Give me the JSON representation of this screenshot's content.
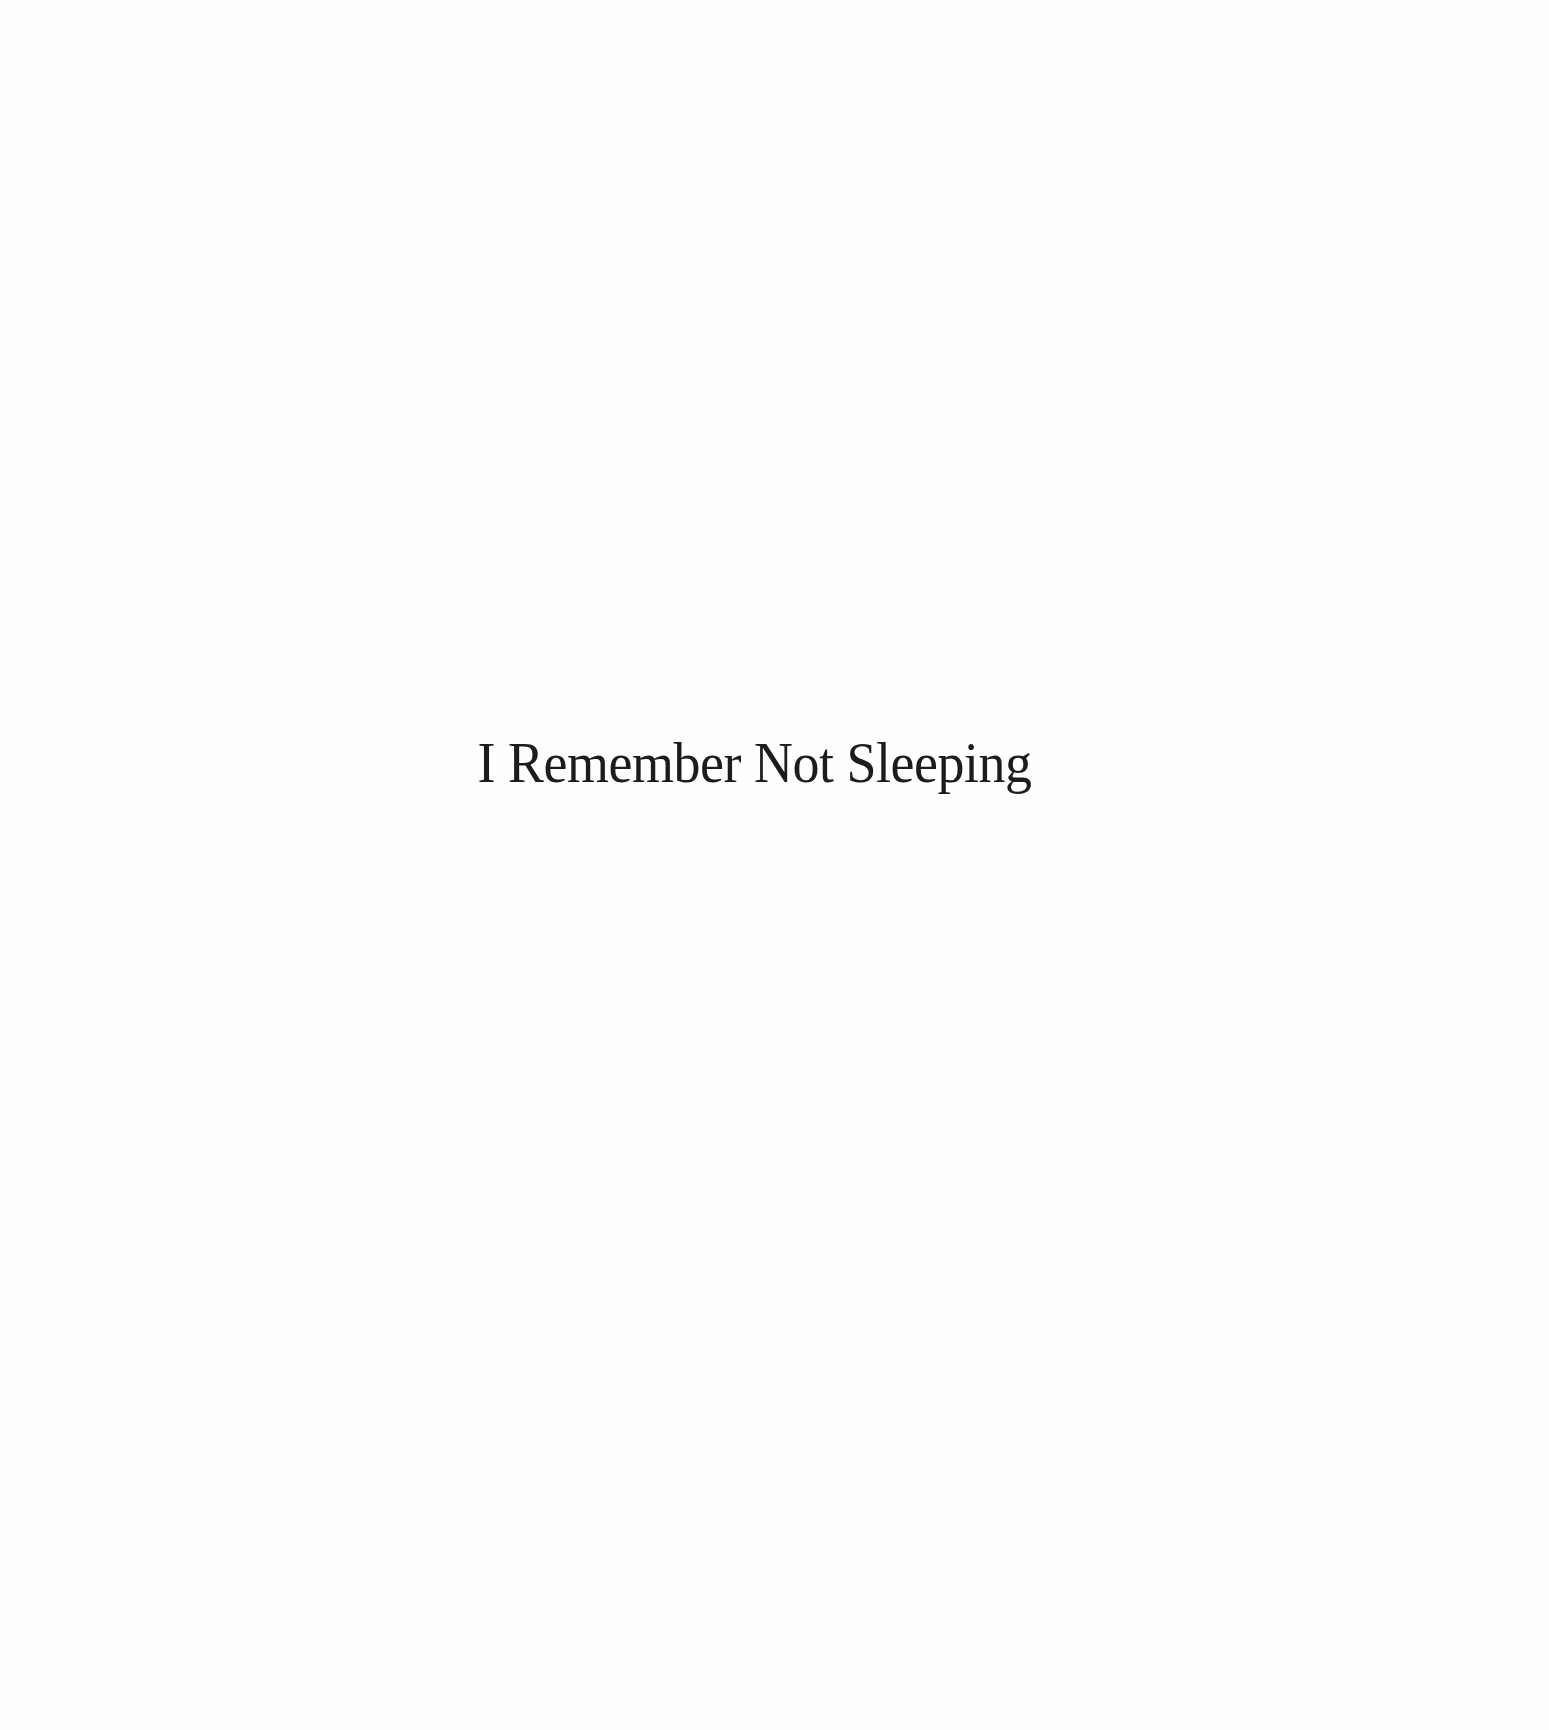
{
  "page": {
    "type": "half-title",
    "background": "#fefefe",
    "text_color": "#1c1c1e"
  },
  "title": "I Remember Not Sleeping"
}
